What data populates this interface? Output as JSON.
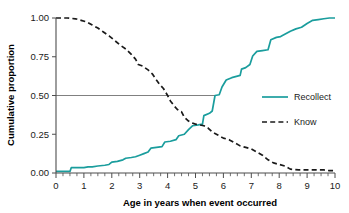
{
  "chart_data": {
    "type": "line",
    "title": "",
    "subtitle": "",
    "xlabel": "Age in years when event occurred",
    "ylabel": "Cumulative proportion",
    "xlim": [
      0,
      10
    ],
    "ylim": [
      0,
      1.0
    ],
    "grid": false,
    "legend_position": "right",
    "x_ticks": [
      0,
      1,
      2,
      3,
      4,
      5,
      6,
      7,
      8,
      9,
      10
    ],
    "x_tick_labels": [
      "0",
      "1",
      "2",
      "3",
      "4",
      "5",
      "6",
      "7",
      "8",
      "9",
      "10"
    ],
    "x_minor_tick_step": 0.25,
    "y_ticks": [
      0.0,
      0.25,
      0.5,
      0.75,
      1.0
    ],
    "y_tick_labels": [
      "0.00",
      "0.25",
      "0.50",
      "0.75",
      "1.00"
    ],
    "annotations": [
      {
        "name": "median-reference-line",
        "type": "horizontal-line",
        "y": 0.5,
        "x_start": 0,
        "x_end": 5.7,
        "color": "#808080"
      }
    ],
    "series": [
      {
        "name": "Recollect",
        "style": "solid",
        "color": "#1a9d9d",
        "points": [
          [
            0.0,
            0.01
          ],
          [
            0.25,
            0.01
          ],
          [
            0.5,
            0.01
          ],
          [
            0.55,
            0.035
          ],
          [
            0.75,
            0.035
          ],
          [
            1.0,
            0.035
          ],
          [
            1.15,
            0.04
          ],
          [
            1.3,
            0.04
          ],
          [
            1.5,
            0.045
          ],
          [
            1.75,
            0.05
          ],
          [
            1.9,
            0.055
          ],
          [
            2.0,
            0.07
          ],
          [
            2.2,
            0.075
          ],
          [
            2.4,
            0.085
          ],
          [
            2.5,
            0.095
          ],
          [
            2.7,
            0.1
          ],
          [
            2.85,
            0.105
          ],
          [
            3.0,
            0.115
          ],
          [
            3.15,
            0.125
          ],
          [
            3.3,
            0.135
          ],
          [
            3.4,
            0.16
          ],
          [
            3.6,
            0.165
          ],
          [
            3.8,
            0.17
          ],
          [
            3.9,
            0.2
          ],
          [
            4.1,
            0.205
          ],
          [
            4.3,
            0.215
          ],
          [
            4.4,
            0.24
          ],
          [
            4.6,
            0.25
          ],
          [
            4.75,
            0.28
          ],
          [
            4.9,
            0.305
          ],
          [
            5.1,
            0.31
          ],
          [
            5.25,
            0.315
          ],
          [
            5.3,
            0.37
          ],
          [
            5.5,
            0.385
          ],
          [
            5.6,
            0.4
          ],
          [
            5.7,
            0.5
          ],
          [
            5.85,
            0.505
          ],
          [
            5.95,
            0.555
          ],
          [
            6.1,
            0.6
          ],
          [
            6.3,
            0.615
          ],
          [
            6.5,
            0.625
          ],
          [
            6.6,
            0.63
          ],
          [
            6.65,
            0.67
          ],
          [
            6.8,
            0.68
          ],
          [
            6.95,
            0.7
          ],
          [
            7.05,
            0.755
          ],
          [
            7.2,
            0.785
          ],
          [
            7.4,
            0.79
          ],
          [
            7.6,
            0.795
          ],
          [
            7.7,
            0.86
          ],
          [
            7.9,
            0.875
          ],
          [
            8.05,
            0.88
          ],
          [
            8.2,
            0.895
          ],
          [
            8.4,
            0.915
          ],
          [
            8.6,
            0.93
          ],
          [
            8.8,
            0.94
          ],
          [
            9.0,
            0.965
          ],
          [
            9.2,
            0.985
          ],
          [
            9.4,
            0.99
          ],
          [
            9.6,
            0.995
          ],
          [
            9.8,
            1.0
          ],
          [
            10.0,
            1.0
          ]
        ]
      },
      {
        "name": "Know",
        "style": "dashed",
        "color": "#1a1a1a",
        "points": [
          [
            0.0,
            1.0
          ],
          [
            0.4,
            1.0
          ],
          [
            0.7,
            0.995
          ],
          [
            0.9,
            0.985
          ],
          [
            1.1,
            0.975
          ],
          [
            1.3,
            0.955
          ],
          [
            1.5,
            0.935
          ],
          [
            1.7,
            0.91
          ],
          [
            1.9,
            0.885
          ],
          [
            2.1,
            0.855
          ],
          [
            2.3,
            0.825
          ],
          [
            2.5,
            0.8
          ],
          [
            2.7,
            0.765
          ],
          [
            2.85,
            0.735
          ],
          [
            2.95,
            0.7
          ],
          [
            3.1,
            0.69
          ],
          [
            3.3,
            0.665
          ],
          [
            3.45,
            0.64
          ],
          [
            3.6,
            0.6
          ],
          [
            3.7,
            0.575
          ],
          [
            3.85,
            0.545
          ],
          [
            4.0,
            0.5
          ],
          [
            4.1,
            0.465
          ],
          [
            4.25,
            0.43
          ],
          [
            4.35,
            0.41
          ],
          [
            4.5,
            0.395
          ],
          [
            4.6,
            0.36
          ],
          [
            4.75,
            0.335
          ],
          [
            4.85,
            0.325
          ],
          [
            5.0,
            0.315
          ],
          [
            5.15,
            0.31
          ],
          [
            5.3,
            0.305
          ],
          [
            5.45,
            0.29
          ],
          [
            5.6,
            0.265
          ],
          [
            5.8,
            0.245
          ],
          [
            6.0,
            0.225
          ],
          [
            6.2,
            0.215
          ],
          [
            6.4,
            0.195
          ],
          [
            6.6,
            0.175
          ],
          [
            6.8,
            0.165
          ],
          [
            7.0,
            0.155
          ],
          [
            7.2,
            0.135
          ],
          [
            7.4,
            0.115
          ],
          [
            7.6,
            0.085
          ],
          [
            7.8,
            0.065
          ],
          [
            8.0,
            0.055
          ],
          [
            8.2,
            0.045
          ],
          [
            8.4,
            0.025
          ],
          [
            8.7,
            0.02
          ],
          [
            9.0,
            0.02
          ],
          [
            9.3,
            0.02
          ],
          [
            9.6,
            0.02
          ],
          [
            9.8,
            0.015
          ],
          [
            10.0,
            0.015
          ]
        ]
      }
    ],
    "legend": [
      {
        "label": "Recollect",
        "style": "solid",
        "color": "#1a9d9d"
      },
      {
        "label": "Know",
        "style": "dashed",
        "color": "#1a1a1a"
      }
    ]
  }
}
